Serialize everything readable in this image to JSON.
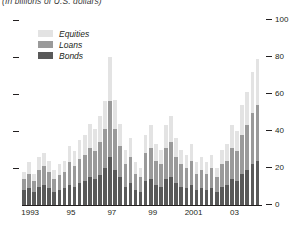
{
  "subtitle": "(In billions of U.S. dollars)",
  "legend": {
    "position": "top-left",
    "items": [
      {
        "label": "Equities",
        "color": "#e3e3e3",
        "key": "equities"
      },
      {
        "label": "Loans",
        "color": "#9a9a9a",
        "key": "loans"
      },
      {
        "label": "Bonds",
        "color": "#595959",
        "key": "bonds"
      }
    ]
  },
  "axes": {
    "y_ticks": [
      "0",
      "20",
      "40",
      "60",
      "80",
      "100"
    ],
    "y_tick_values": [
      0,
      20,
      40,
      60,
      80,
      100
    ],
    "x_tick_labels": [
      "1993",
      "95",
      "97",
      "99",
      "2001",
      "03"
    ],
    "x_tick_quarters": [
      0,
      8,
      16,
      24,
      32,
      40
    ]
  },
  "chart_data": {
    "type": "bar",
    "stacked": true,
    "title": "",
    "subtitle": "(In billions of U.S. dollars)",
    "xlabel": "",
    "ylabel": "",
    "ylim": [
      0,
      100
    ],
    "grid": false,
    "legend_position": "top-left",
    "categories": [
      "1993Q1",
      "1993Q2",
      "1993Q3",
      "1993Q4",
      "1994Q1",
      "1994Q2",
      "1994Q3",
      "1994Q4",
      "1995Q1",
      "1995Q2",
      "1995Q3",
      "1995Q4",
      "1996Q1",
      "1996Q2",
      "1996Q3",
      "1996Q4",
      "1997Q1",
      "1997Q2",
      "1997Q3",
      "1997Q4",
      "1998Q1",
      "1998Q2",
      "1998Q3",
      "1998Q4",
      "1999Q1",
      "1999Q2",
      "1999Q3",
      "1999Q4",
      "2000Q1",
      "2000Q2",
      "2000Q3",
      "2000Q4",
      "2001Q1",
      "2001Q2",
      "2001Q3",
      "2001Q4",
      "2002Q1",
      "2002Q2",
      "2002Q3",
      "2002Q4",
      "2003Q1",
      "2003Q2",
      "2003Q3",
      "2003Q4",
      "2004Q1",
      "2004Q2",
      "2004Q3"
    ],
    "series": [
      {
        "name": "Bonds",
        "color": "#595959",
        "values": [
          8,
          9,
          7,
          10,
          11,
          9,
          7,
          8,
          9,
          11,
          10,
          12,
          13,
          15,
          14,
          16,
          20,
          26,
          19,
          15,
          10,
          12,
          8,
          7,
          13,
          14,
          11,
          10,
          14,
          15,
          12,
          10,
          9,
          11,
          8,
          9,
          8,
          9,
          7,
          10,
          11,
          14,
          13,
          17,
          19,
          22,
          24
        ]
      },
      {
        "name": "Loans",
        "color": "#9a9a9a",
        "values": [
          6,
          8,
          6,
          9,
          10,
          9,
          7,
          8,
          9,
          12,
          11,
          13,
          14,
          16,
          15,
          18,
          21,
          30,
          22,
          17,
          12,
          14,
          9,
          8,
          15,
          17,
          13,
          12,
          17,
          19,
          14,
          12,
          11,
          13,
          9,
          10,
          9,
          11,
          8,
          12,
          13,
          17,
          16,
          21,
          24,
          28,
          30
        ]
      },
      {
        "name": "Equities",
        "color": "#e3e3e3",
        "values": [
          4,
          6,
          4,
          7,
          7,
          6,
          5,
          6,
          6,
          9,
          8,
          10,
          11,
          13,
          12,
          14,
          15,
          24,
          16,
          12,
          8,
          10,
          6,
          5,
          10,
          12,
          9,
          8,
          12,
          14,
          10,
          8,
          7,
          9,
          6,
          7,
          6,
          7,
          5,
          8,
          9,
          12,
          11,
          16,
          18,
          22,
          25
        ]
      }
    ]
  }
}
